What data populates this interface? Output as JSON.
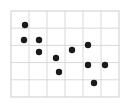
{
  "chart_data": {
    "type": "scatter",
    "title": "",
    "subtitle": "",
    "xlabel": "",
    "ylabel": "",
    "grid": true,
    "legend": null,
    "legend_position": "none",
    "xlim": [
      0,
      6
    ],
    "ylim": [
      0,
      5
    ],
    "xticks": [
      0,
      1,
      2,
      3,
      4,
      5,
      6
    ],
    "yticks": [
      0,
      1,
      2,
      3,
      4,
      5
    ],
    "xticklabels": [
      "",
      "",
      "",
      "",
      "",
      "",
      ""
    ],
    "yticklabels": [
      "",
      "",
      "",
      "",
      "",
      ""
    ],
    "marker": "filled-circle",
    "marker_color": "#1a1a1a",
    "marker_size_px": 3.2,
    "grid_color": "#d9d9d9",
    "frame_color": "#cccccc",
    "background": "#ffffff",
    "plot_area_px": {
      "x0": 11,
      "y0": 11,
      "x1": 119,
      "y1": 97
    },
    "points": [
      {
        "x": 0.78,
        "y": 4.19,
        "px": 25,
        "py": 25
      },
      {
        "x": 0.72,
        "y": 3.31,
        "px": 24,
        "py": 40
      },
      {
        "x": 1.56,
        "y": 3.31,
        "px": 39,
        "py": 40
      },
      {
        "x": 1.56,
        "y": 2.62,
        "px": 39,
        "py": 52
      },
      {
        "x": 2.5,
        "y": 2.27,
        "px": 56,
        "py": 58
      },
      {
        "x": 2.67,
        "y": 1.45,
        "px": 59,
        "py": 72
      },
      {
        "x": 3.39,
        "y": 2.73,
        "px": 72,
        "py": 50
      },
      {
        "x": 4.28,
        "y": 3.02,
        "px": 88,
        "py": 45
      },
      {
        "x": 4.28,
        "y": 1.86,
        "px": 88,
        "py": 65
      },
      {
        "x": 5.22,
        "y": 1.86,
        "px": 105,
        "py": 65
      },
      {
        "x": 4.61,
        "y": 0.81,
        "px": 94,
        "py": 83
      }
    ],
    "point_count": 11
  }
}
